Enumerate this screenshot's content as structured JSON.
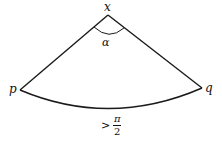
{
  "diagram": {
    "type": "circular-sector",
    "vertex_labels": {
      "apex": "x",
      "left": "p",
      "right": "q"
    },
    "angle_label": "α",
    "arc_label": {
      "relation": ">",
      "numerator": "π",
      "denominator": "2"
    },
    "stroke_color": "#1a1a1a"
  }
}
